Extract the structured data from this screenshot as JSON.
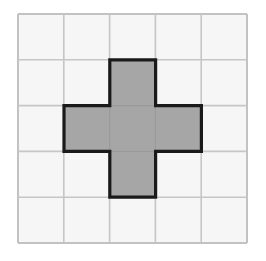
{
  "figure": {
    "title": "Plus pentomino shaded on a 5 by 5 square grid",
    "type": "grid-shape-diagram"
  },
  "canvas": {
    "width": 266,
    "height": 261,
    "background_color": "#ffffff"
  },
  "grid": {
    "columns": 5,
    "rows": 5,
    "origin_x": 18,
    "origin_y": 14,
    "cell_width": 45.8,
    "cell_height": 45.8,
    "cell_fill_color": "#f6f6f6",
    "line_color": "#c6c6c6",
    "line_width": 1.6,
    "outer_line_color": "#c2c2c2",
    "outer_line_width": 2
  },
  "shape": {
    "name": "plus-pentomino",
    "cell_count": 5,
    "fill_color": "#a6a6a6",
    "outline_color": "#1a1a1a",
    "outline_width": 3.2,
    "cells": [
      {
        "row": 2,
        "col": 3,
        "label": "top-arm"
      },
      {
        "row": 3,
        "col": 2,
        "label": "left-arm"
      },
      {
        "row": 3,
        "col": 3,
        "label": "center"
      },
      {
        "row": 3,
        "col": 4,
        "label": "right-arm"
      },
      {
        "row": 4,
        "col": 3,
        "label": "bottom-arm"
      }
    ],
    "outline_path": "M 109.8 59.8 L 155.6 59.8 L 155.6 105.6 L 201.4 105.6 L 201.4 151.4 L 155.6 151.4 L 155.6 197.2 L 109.8 197.2 L 109.8 151.4 L 64.0 151.4 L 64.0 105.6 L 109.8 105.6 Z"
  }
}
